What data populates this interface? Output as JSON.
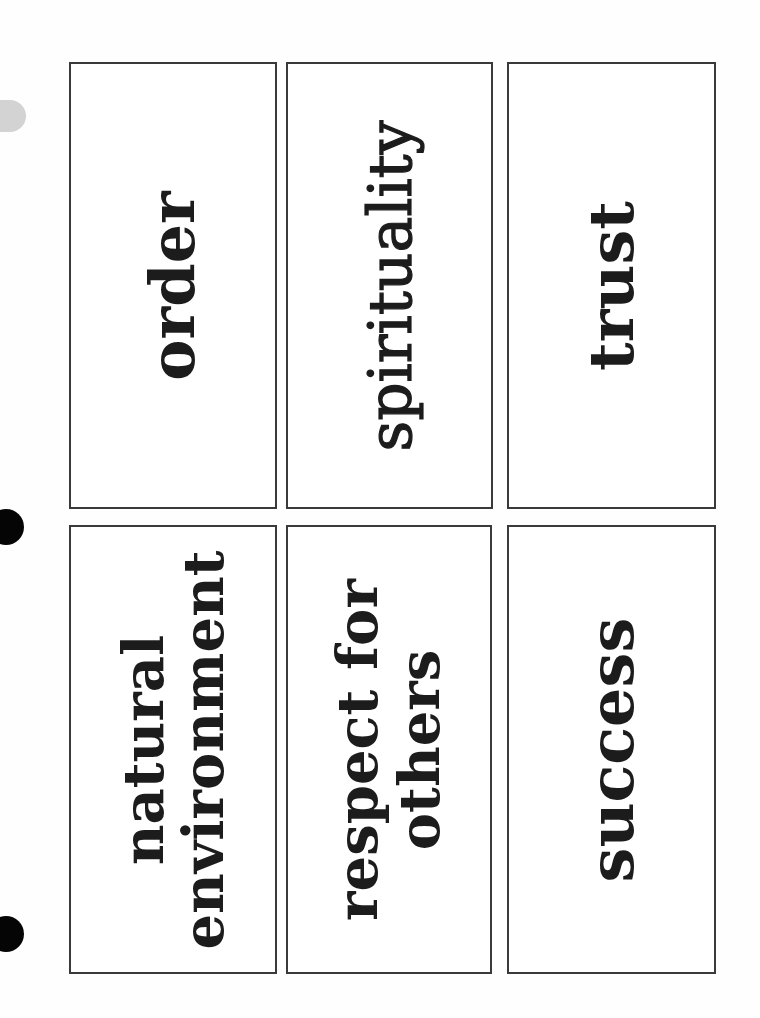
{
  "document": {
    "type": "word-card worksheet",
    "orientation": "cards rotated 90deg counter-clockwise",
    "colors": {
      "paper": "#fefefe",
      "border": "#3a3a3a",
      "text": "#1c1c1c",
      "hole_dark": "#050505",
      "hole_light": "#d3d3d3"
    }
  },
  "cards": [
    {
      "lines": [
        "order"
      ]
    },
    {
      "lines": [
        "spirituality"
      ]
    },
    {
      "lines": [
        "trust"
      ]
    },
    {
      "lines": [
        "natural",
        "environment"
      ]
    },
    {
      "lines": [
        "respect for",
        "others"
      ]
    },
    {
      "lines": [
        "success"
      ]
    }
  ]
}
